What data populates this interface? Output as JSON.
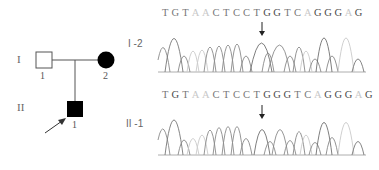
{
  "figure": {
    "pedigree": {
      "generations": [
        {
          "label": "I",
          "individuals": [
            {
              "number": "1",
              "sex": "male",
              "affected": false
            },
            {
              "number": "2",
              "sex": "female",
              "affected": true
            }
          ]
        },
        {
          "label": "II",
          "individuals": [
            {
              "number": "1",
              "sex": "male",
              "affected": true,
              "proband": true
            }
          ]
        }
      ]
    },
    "chromatograms": [
      {
        "label": "I -2",
        "sequence": [
          "T",
          "G",
          "T",
          "A",
          "A",
          "C",
          "T",
          "C",
          "C",
          "T",
          "G",
          "G",
          "T",
          "C",
          "A",
          "G",
          "G",
          "G",
          "A",
          "G"
        ],
        "arrow_position_index": 10
      },
      {
        "label": "II -1",
        "sequence": [
          "T",
          "G",
          "T",
          "A",
          "A",
          "C",
          "T",
          "C",
          "C",
          "T",
          "G",
          "G",
          "G",
          "T",
          "C",
          "A",
          "G",
          "G",
          "G",
          "A",
          "G"
        ],
        "arrow_position_index": 10
      }
    ]
  }
}
